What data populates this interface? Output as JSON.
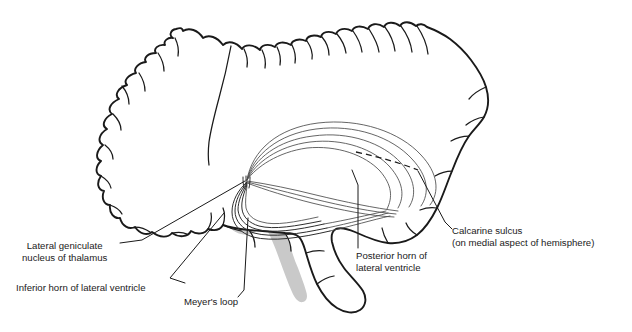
{
  "figure": {
    "background_color": "#ffffff",
    "outline_color": "#1a1a1a",
    "ventricle_shade_color": "#c9c9c9",
    "fiber_color": "#4a4a4a"
  },
  "labels": {
    "lateral_geniculate": {
      "line1": "Lateral geniculate",
      "line2": "nucleus of thalamus"
    },
    "inferior_horn": {
      "line1": "Inferior horn of lateral ventricle"
    },
    "meyers_loop": {
      "line1": "Meyer's loop"
    },
    "posterior_horn": {
      "line1": "Posterior horn of",
      "line2": "lateral ventricle"
    },
    "calcarine_sulcus": {
      "line1": "Calcarine sulcus",
      "line2": "(on medial aspect of hemisphere)"
    }
  },
  "structures": {
    "brain_outline": "cerebral-hemisphere-lateral-outline",
    "lateral_ventricle": "lateral-ventricle-shaded",
    "brainstem": "brainstem-shaded",
    "optic_radiation": "optic-radiation-fiber-bundle",
    "calcarine_marker": "calcarine-sulcus-dashed-line"
  }
}
